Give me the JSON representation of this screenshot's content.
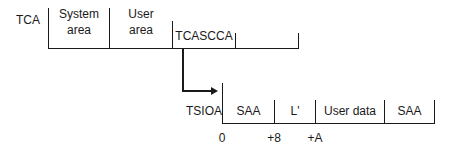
{
  "tca": {
    "label": "TCA",
    "fields": [
      {
        "line1": "System",
        "line2": "area"
      },
      {
        "line1": "User",
        "line2": "area"
      },
      {
        "label": "TCASCCA"
      }
    ]
  },
  "tsioa": {
    "label": "TSIOA",
    "fields": [
      "SAA",
      "L'",
      "User data",
      "SAA"
    ],
    "offsets": [
      "0",
      "+8",
      "+A"
    ]
  }
}
